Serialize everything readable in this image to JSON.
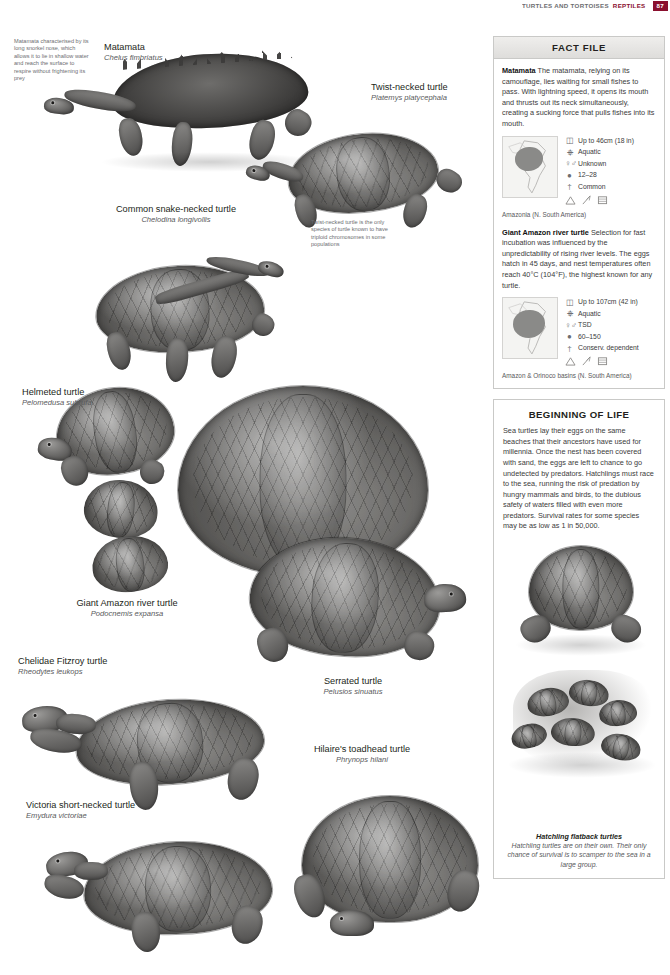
{
  "running_header": {
    "text": "TURTLES AND TORTOISES",
    "accent_text": "REPTILES",
    "folio": "87"
  },
  "annotations": [
    {
      "id": "matamata-note",
      "text": "Matamata characterised by its long snorkel nose, which allows it to lie in shallow water and reach the surface to respire without frightening its prey"
    },
    {
      "id": "twist-necked-note",
      "text": "Twist-necked turtle is the only species of turtle known to have triploid chromosomes in some populations"
    }
  ],
  "species": [
    {
      "common": "Matamata",
      "latin": "Chelus fimbriatus"
    },
    {
      "common": "Twist-necked turtle",
      "latin": "Platemys platycephala"
    },
    {
      "common": "Common snake-necked turtle",
      "latin": "Chelodina longivollis"
    },
    {
      "common": "Helmeted turtle",
      "latin": "Pelomedusa subrufa"
    },
    {
      "common": "Giant Amazon river turtle",
      "latin": "Podocnemis expansa"
    },
    {
      "common": "Chelidae Fitzroy turtle",
      "latin": "Rheodytes leukops"
    },
    {
      "common": "Serrated turtle",
      "latin": "Pelusios sinuatus"
    },
    {
      "common": "Hilaire's toadhead turtle",
      "latin": "Phrynops hilani"
    },
    {
      "common": "Victoria short-necked turtle",
      "latin": "Emydura victoriae"
    }
  ],
  "fact_file": {
    "title": "FACT FILE",
    "entries": [
      {
        "name": "Matamata",
        "body": "The matamata, relying on its camouflage, lies waiting for small fishes to pass. With lightning speed, it opens its mouth and thrusts out its neck simultaneously, creating a sucking force that pulls fishes into its mouth.",
        "facts": [
          {
            "icon": "size-icon",
            "label": "Up to 46cm (18 in)"
          },
          {
            "icon": "habitat-aquatic-icon",
            "label": "Aquatic"
          },
          {
            "icon": "sex-determination-icon",
            "label": "Unknown"
          },
          {
            "icon": "clutch-eggs-icon",
            "label": "12–28"
          },
          {
            "icon": "conservation-status-icon",
            "label": "Common"
          }
        ],
        "symbols": [
          "mountain-icon",
          "tree-icon",
          "grass-icon"
        ],
        "range_caption": "Amazonia (N. South America)"
      },
      {
        "name": "Giant Amazon river turtle",
        "body": "Selection for fast incubation was influenced by the unpredictability of rising river levels. The eggs hatch in 45 days, and nest temperatures often reach 40°C (104°F), the highest known for any turtle.",
        "facts": [
          {
            "icon": "size-icon",
            "label": "Up to 107cm (42 in)"
          },
          {
            "icon": "habitat-aquatic-icon",
            "label": "Aquatic"
          },
          {
            "icon": "sex-determination-icon",
            "label": "TSD"
          },
          {
            "icon": "clutch-eggs-icon",
            "label": "60–150"
          },
          {
            "icon": "conservation-status-icon",
            "label": "Conserv. dependent"
          }
        ],
        "symbols": [
          "mountain-icon",
          "tree-icon",
          "grass-icon"
        ],
        "range_caption": "Amazon & Orinoco basins (N. South America)"
      }
    ]
  },
  "beginning_of_life": {
    "title": "BEGINNING OF LIFE",
    "body": "Sea turtles lay their eggs on the same beaches that their ancestors have used for millennia. Once the nest has been covered with sand, the eggs are left to chance to go undetected by predators. Hatchlings must race to the sea, running the risk of predation by hungry mammals and birds, to the dubious safety of waters filled with even more predators. Survival rates for some species may be as low as 1 in 50,000.",
    "caption_title": "Hatchling flatback turtles",
    "caption_text": "Hatchling turtles are on their own. Their only chance of survival is to scamper to the sea in a large group."
  },
  "colors": {
    "accent": "#8a0f2e",
    "panel_border": "#c9c9c7",
    "panel_header_bg": "#e4e3e1",
    "text": "#231f20",
    "muted": "#58595b"
  }
}
